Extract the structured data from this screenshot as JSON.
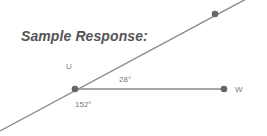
{
  "title": "Sample Response:",
  "diagram": {
    "points": {
      "U": {
        "label": "U",
        "x": 75,
        "y": 89
      },
      "W": {
        "label": "W",
        "x": 224,
        "y": 89
      },
      "top": {
        "label": "",
        "x": 215,
        "y": 14
      }
    },
    "angles": {
      "upper": "28°",
      "lower": "152°"
    },
    "colors": {
      "line": "#888888",
      "point": "#666666",
      "text": "#777777"
    }
  }
}
